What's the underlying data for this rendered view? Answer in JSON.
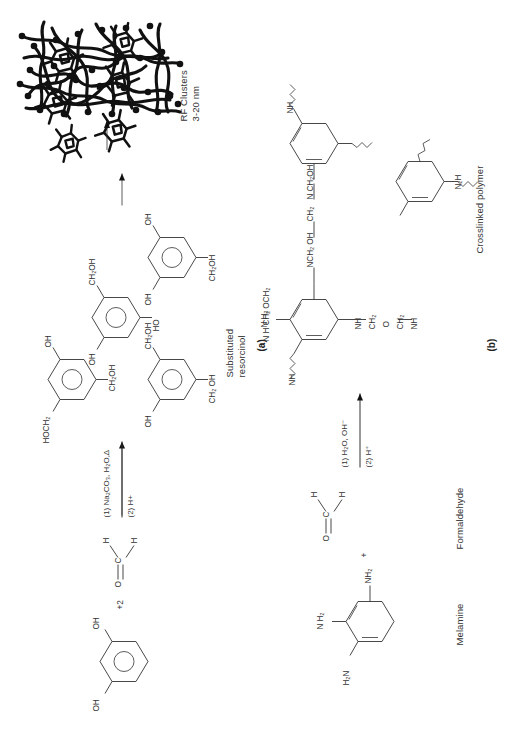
{
  "figure": {
    "orientation": "rotated-90-ccw",
    "panels": [
      {
        "id": "a",
        "label": "(a)",
        "title_reactant": "",
        "steps": [
          {
            "name": "resorcinol",
            "formula_labels": [
              "OH",
              "OH"
            ]
          },
          {
            "name": "formaldehyde",
            "formula_labels": [
              "O",
              "C",
              "H",
              "H"
            ],
            "stoich": "+2"
          },
          {
            "name": "substituted-resorcinol",
            "caption_line1": "Substituted",
            "caption_line2": "resorcinol"
          },
          {
            "name": "rf-clusters",
            "caption_line1": "RF Clusters",
            "caption_line2": "3-20 nm"
          },
          {
            "name": "crosslinked-gel",
            "caption_line1": "Crosslinked",
            "caption_line2": "gel"
          }
        ],
        "conditions": [
          {
            "line1": "(1) Na₂CO₃, H₂O,Δ",
            "line2": "(2) H+"
          }
        ]
      },
      {
        "id": "b",
        "label": "(b)",
        "steps": [
          {
            "name": "melamine",
            "caption": "Melamine"
          },
          {
            "name": "formaldehyde",
            "caption": "Formaldehyde"
          },
          {
            "name": "crosslinked-polymer",
            "caption": "Crosslinked polymer"
          }
        ],
        "conditions": [
          {
            "line1": "(1) H₂O, OH⁻",
            "line2": "(2) H⁺"
          }
        ]
      }
    ],
    "captions": {
      "substituted_resorcinol_l1": "Substituted",
      "substituted_resorcinol_l2": "resorcinol",
      "rf_clusters_l1": "RF Clusters",
      "rf_clusters_l2": "3-20 nm",
      "crosslinked_gel_l1": "Crosslinked",
      "crosslinked_gel_l2": "gel",
      "melamine": "Melamine",
      "formaldehyde": "Formaldehyde",
      "crosslinked_polymer": "Crosslinked polymer",
      "panel_a": "(a)",
      "panel_b": "(b)"
    },
    "conditions": {
      "a_line1": "(1) Na₂CO₃, H₂O,Δ",
      "a_line2": "(2) H+",
      "b_line1": "(1) H₂O, OH⁻",
      "b_line2": "(2) H⁺"
    },
    "chem_text": {
      "resorcinol_oh_left": "OH",
      "resorcinol_oh_right": "OH",
      "plus_two": "+2",
      "fa_O": "O",
      "fa_C": "C",
      "fa_H_top": "H",
      "fa_H_bottom": "H",
      "sr1_HOCH2": "HOCH₂",
      "sr1_OH_a": "OH",
      "sr1_OH_b": "OH",
      "sr1_CH2OH_a": "CH₂OH",
      "sr1_CH2OH_b": "CH₂OH",
      "sr2_OH_a": "OH",
      "sr2_HO": "HO",
      "sr2_CH2OH_a": "CH₂OH",
      "sr2_CH2OH_b": "CH₂OH",
      "sr2_CH2OH_c": "CH₂ OH",
      "sr3_OH_a": "OH",
      "sr3_OH_b": "OH",
      "sr3_CH2OH_a": "CH₂OH",
      "sr3_CH2OH_b": "CH₂OH",
      "sr3_CH2OH_c": "CH₂ OH",
      "sr4_OH_a": "OH",
      "sr4_OH_b": "OH",
      "sr4_CH2OH_a": "CH₂OH",
      "mel_H2N": "H₂N",
      "mel_NH2_right": "NH₂",
      "mel_NH2_top": "N H₂",
      "mel_N": "N",
      "mel_C": "C",
      "fb_O": "O",
      "fb_C": "C",
      "fb_H_top": "H",
      "fb_H_bottom": "H",
      "plus_b": "+",
      "cp_NH": "NH",
      "cp_NH_2": "NH",
      "cp_N": "N",
      "cp_C": "C",
      "cp_NCH2OH_1": "NCH₂ OH",
      "cp_CH2": "CH₂",
      "cp_NCH2OH_2": "N CH₂OH",
      "cp_NHCH2OCH2": "N H CH₂ OCH₂",
      "cp_NH_bridge": "NH",
      "cp_NH_b": "NH",
      "cp_CH2_b": "CH₂",
      "cp_O_b": "O",
      "cp_CH2_c": "CH₂",
      "cp_NH_c": "NH",
      "cp_NH2_top": "N H₂",
      "cp_N2H": "N₂H",
      "cp_NH_wavy": "NH"
    }
  }
}
